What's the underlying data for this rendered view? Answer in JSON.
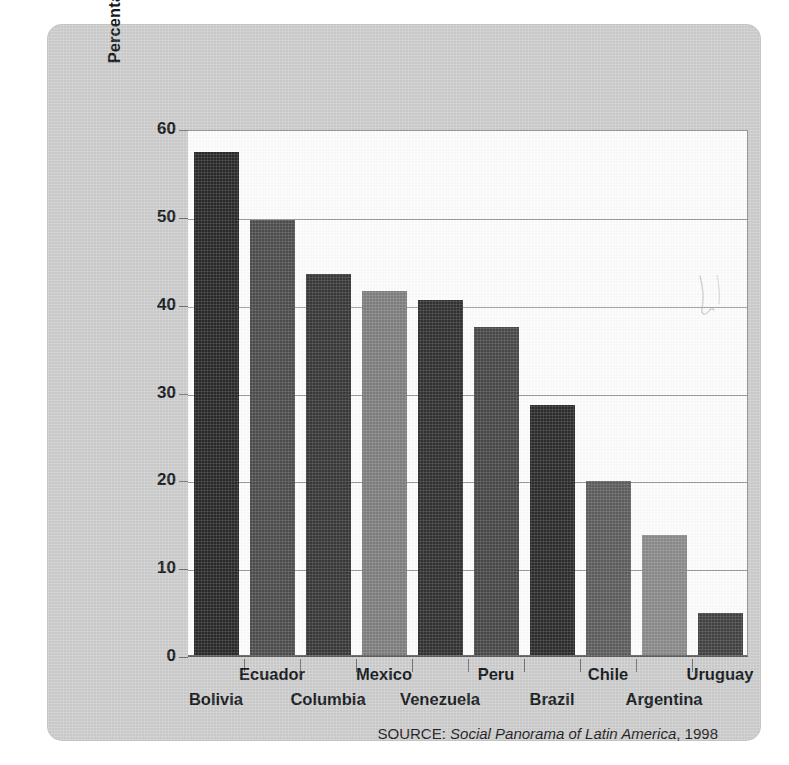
{
  "figure": {
    "source_prefix": "SOURCE:",
    "source_title": "Social Panorama of Latin America",
    "source_year": ", 1998"
  },
  "chart_data": {
    "type": "bar",
    "title": "",
    "xlabel": "",
    "ylabel": "Percentage of Population Living in Poverty",
    "ylim": [
      0,
      60
    ],
    "yticks": [
      0,
      10,
      20,
      30,
      40,
      50,
      60
    ],
    "ytick_labels": [
      "0",
      "10",
      "20",
      "30",
      "40",
      "50",
      "60"
    ],
    "grid": true,
    "legend": "none",
    "categories": [
      "Bolivia",
      "Ecuador",
      "Columbia",
      "Mexico",
      "Venezuela",
      "Peru",
      "Brazil",
      "Chile",
      "Argentina",
      "Uruguay"
    ],
    "values": [
      57.3,
      49.5,
      43.4,
      41.5,
      40.4,
      37.4,
      28.5,
      19.8,
      13.7,
      4.8
    ],
    "bar_colors": [
      "#2b2b2b",
      "#4f4f4f",
      "#3a3a3a",
      "#818181",
      "#333333",
      "#4a4a4a",
      "#2e2e2e",
      "#5f5f5f",
      "#8c8c8c",
      "#444444"
    ],
    "label_rows": [
      "bottom",
      "top",
      "bottom",
      "top",
      "bottom",
      "top",
      "bottom",
      "top",
      "bottom",
      "top"
    ]
  },
  "colors": {
    "panel_background": "#cfcfcf",
    "plot_background": "#ffffff",
    "gridline": "#9a9a9a",
    "axis": "#5d5d5d",
    "text": "#15191c"
  }
}
